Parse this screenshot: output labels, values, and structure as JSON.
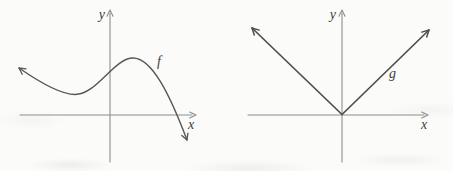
{
  "figure": {
    "background_color": "#fbfbf9",
    "axis_color": "#8e8e8e",
    "f_curve_color": "#575757",
    "g_curve_color": "#4e4e4e",
    "label_color": "#3e3e3e"
  },
  "left_graph": {
    "y_label": "y",
    "x_label": "x",
    "curve_label": "f",
    "x_axis_path": "M20,115 L192,115",
    "x_axis_arrow": "M189.7,112 L196,115 L189.7,118",
    "y_axis_path": "M110,162 L110,13",
    "y_axis_arrow": "M107,16.3 L110,10 L113,16.3",
    "curve_path": "M19,68 C32,77 58,94.5 75,94.5 C97,94.5 114,58 133,58 C152,58 170,95 187,140",
    "curve_start_arrow": "M22.2,74.2 L19,68 L26,68.8",
    "curve_end_arrow": "M187.9,133.1 L187,140 L181.8,135.4"
  },
  "right_graph": {
    "y_label": "y",
    "x_label": "x",
    "curve_label": "g",
    "x_axis_path": "M22,115 L198,115",
    "x_axis_arrow": "M195.7,112 L202,115 L195.7,118",
    "y_axis_path": "M116,162 L116,13",
    "y_axis_arrow": "M113,16.3 L116,10 L119,16.3",
    "curve_path": "M26,28 L116,114.5 L203,30",
    "left_branch_arrow": "M28.3,35.1 L26,28 L33.2,30.1",
    "right_branch_arrow": "M195.8,32.1 L203,30 L200.7,37.1"
  },
  "chart_data": [
    {
      "type": "line",
      "title": "qualitative graph of function f",
      "xlabel": "x",
      "ylabel": "y",
      "grid": false,
      "legend_position": "inline-curve-label",
      "axes_style": "unlabeled axes with arrowheads, no ticks",
      "series": [
        {
          "name": "f",
          "shape": "smooth cubic-like curve with arrows on both ends: comes from upper left, falls to a local minimum in quadrant II, rises crossing the y-axis, reaches a local maximum in quadrant I, then falls crossing the x-axis and continues down to the right",
          "approx_points_axis_units": [
            [
              -91,
              47
            ],
            [
              -60,
              32
            ],
            [
              -35,
              20.5
            ],
            [
              0,
              44
            ],
            [
              23,
              57
            ],
            [
              50,
              30
            ],
            [
              66,
              0
            ],
            [
              77,
              -25
            ]
          ]
        }
      ]
    },
    {
      "type": "line",
      "title": "qualitative graph of function g",
      "xlabel": "x",
      "ylabel": "y",
      "grid": false,
      "legend_position": "inline-curve-label",
      "axes_style": "unlabeled axes with arrowheads, no ticks",
      "series": [
        {
          "name": "g",
          "shape": "V-shaped absolute-value-like graph with vertex at the origin; both branches rise at about 45 degrees and end in arrows",
          "approx_points_axis_units": [
            [
              -90,
              87
            ],
            [
              0,
              0
            ],
            [
              87,
              85
            ]
          ]
        }
      ]
    }
  ]
}
